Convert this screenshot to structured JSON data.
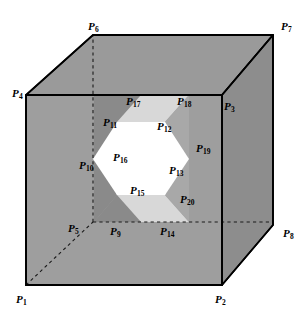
{
  "figure": {
    "colors": {
      "outline": "#000000",
      "front_face": "#9e9e9e",
      "top_face": "#9a9a9a",
      "right_face": "#8d8d8d",
      "tunnel_band_light": "#d8d8d8",
      "tunnel_band_mid": "#c4c4c4",
      "tunnel_band_dark": "#8a8a8a",
      "tunnel_hole": "#ffffff",
      "hidden_line": "#1a1a1a",
      "label_text": "#000000"
    },
    "points": [
      {
        "id": "P1",
        "base": "P",
        "sub": "1",
        "x": 16,
        "y": 294,
        "role": "cube-vertex-front-bottom-left"
      },
      {
        "id": "P2",
        "base": "P",
        "sub": "2",
        "x": 215,
        "y": 294,
        "role": "cube-vertex-front-bottom-right"
      },
      {
        "id": "P3",
        "base": "P",
        "sub": "3",
        "x": 224,
        "y": 101,
        "role": "cube-vertex-front-top-right"
      },
      {
        "id": "P4",
        "base": "P",
        "sub": "4",
        "x": 12,
        "y": 88,
        "role": "cube-vertex-front-top-left"
      },
      {
        "id": "P5",
        "base": "P",
        "sub": "5",
        "x": 68,
        "y": 223,
        "role": "cube-vertex-back-bottom-left-hidden"
      },
      {
        "id": "P6",
        "base": "P",
        "sub": "6",
        "x": 88,
        "y": 21,
        "role": "cube-vertex-back-top-left"
      },
      {
        "id": "P7",
        "base": "P",
        "sub": "7",
        "x": 281,
        "y": 21,
        "role": "cube-vertex-back-top-right"
      },
      {
        "id": "P8",
        "base": "P",
        "sub": "8",
        "x": 283,
        "y": 228,
        "role": "cube-vertex-back-bottom-right"
      },
      {
        "id": "P9",
        "base": "P",
        "sub": "9",
        "x": 110,
        "y": 226,
        "role": "tunnel-back-bottom-left"
      },
      {
        "id": "P10",
        "base": "P",
        "sub": "10",
        "x": 79,
        "y": 160,
        "role": "tunnel-back-left"
      },
      {
        "id": "P11",
        "base": "P",
        "sub": "11",
        "x": 103,
        "y": 117,
        "role": "tunnel-front-upper-left"
      },
      {
        "id": "P12",
        "base": "P",
        "sub": "12",
        "x": 157,
        "y": 121,
        "role": "tunnel-front-upper-right"
      },
      {
        "id": "P13",
        "base": "P",
        "sub": "13",
        "x": 169,
        "y": 165,
        "role": "tunnel-front-right"
      },
      {
        "id": "P14",
        "base": "P",
        "sub": "14",
        "x": 160,
        "y": 226,
        "role": "tunnel-back-bottom-right"
      },
      {
        "id": "P15",
        "base": "P",
        "sub": "15",
        "x": 130,
        "y": 185,
        "role": "tunnel-front-lower-left"
      },
      {
        "id": "P16",
        "base": "P",
        "sub": "16",
        "x": 113,
        "y": 152,
        "role": "tunnel-front-left"
      },
      {
        "id": "P17",
        "base": "P",
        "sub": "17",
        "x": 126,
        "y": 96,
        "role": "tunnel-back-upper-left"
      },
      {
        "id": "P18",
        "base": "P",
        "sub": "18",
        "x": 177,
        "y": 96,
        "role": "tunnel-back-upper-right"
      },
      {
        "id": "P19",
        "base": "P",
        "sub": "19",
        "x": 196,
        "y": 143,
        "role": "tunnel-back-right"
      },
      {
        "id": "P20",
        "base": "P",
        "sub": "20",
        "x": 180,
        "y": 194,
        "role": "tunnel-back-lower-right"
      }
    ]
  }
}
